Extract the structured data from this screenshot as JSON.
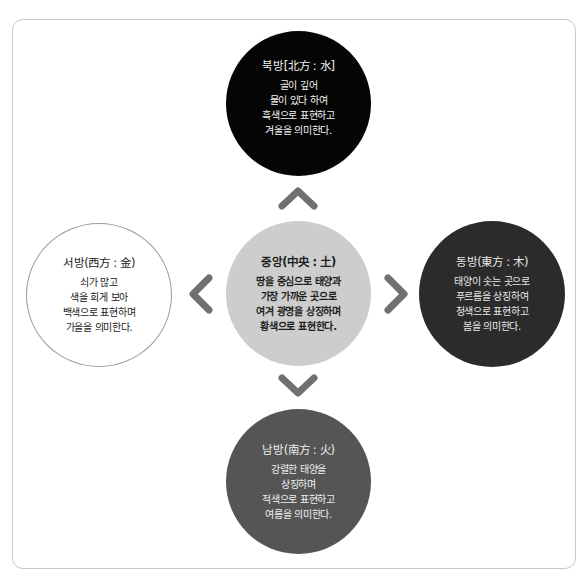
{
  "diagram": {
    "colors": {
      "north": "#050505",
      "center": "#cdcdcd",
      "west": "#ffffff",
      "east": "#2b2b2b",
      "south": "#555555",
      "arrow": "#707070",
      "frame_border": "#c8c8c8"
    },
    "nodes": {
      "north": {
        "title": "북방[北方 : 水]",
        "lines": [
          "골이 깊어",
          "물이 있다 하여",
          "흑색으로 표현하고",
          "겨울을 의미한다."
        ]
      },
      "center": {
        "title": "중앙(中央 : 土)",
        "lines": [
          "땅을 중심으로 태양과",
          "가장 가까운 곳으로",
          "여겨 광명을 상징하며",
          "황색으로 표현한다."
        ]
      },
      "west": {
        "title": "서방(西方 : 金)",
        "lines": [
          "쇠가 많고",
          "색을 희게 보아",
          "백색으로 표현하며",
          "가을을 의미한다."
        ]
      },
      "east": {
        "title": "동방(東方 : 木)",
        "lines": [
          "태양이 솟는 곳으로",
          "푸르름을 상징하여",
          "청색으로 표현하고",
          "봄을 의미한다."
        ]
      },
      "south": {
        "title": "남방(南方 : 火)",
        "lines": [
          "강렬한 태양을",
          "상징하며",
          "적색으로 표현하고",
          "여름을 의미한다."
        ]
      }
    },
    "arrows": [
      {
        "direction": "up",
        "icon": "chevron-up-icon"
      },
      {
        "direction": "down",
        "icon": "chevron-down-icon"
      },
      {
        "direction": "left",
        "icon": "chevron-left-icon"
      },
      {
        "direction": "right",
        "icon": "chevron-right-icon"
      }
    ]
  }
}
